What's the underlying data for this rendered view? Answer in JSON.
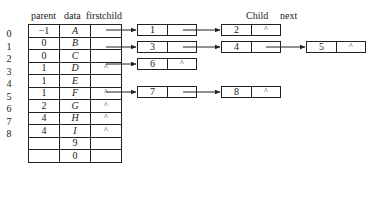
{
  "headers": {
    "parent": "parent",
    "data": "data",
    "firstchild": "firstchild",
    "child": "Child",
    "next": "next"
  },
  "rows": [
    {
      "index": "0",
      "parent": "−1",
      "data": "A",
      "firstchild": ""
    },
    {
      "index": "1",
      "parent": "0",
      "data": "B",
      "firstchild": ""
    },
    {
      "index": "2",
      "parent": "0",
      "data": "C",
      "firstchild": ""
    },
    {
      "index": "3",
      "parent": "1",
      "data": "D",
      "firstchild": "^"
    },
    {
      "index": "4",
      "parent": "1",
      "data": "E",
      "firstchild": ""
    },
    {
      "index": "5",
      "parent": "1",
      "data": "F",
      "firstchild": "^"
    },
    {
      "index": "6",
      "parent": "2",
      "data": "G",
      "firstchild": "^"
    },
    {
      "index": "7",
      "parent": "4",
      "data": "H",
      "firstchild": "^"
    },
    {
      "index": "8",
      "parent": "4",
      "data": "I",
      "firstchild": "^"
    },
    {
      "index": "",
      "parent": "",
      "data": "9",
      "firstchild": ""
    },
    {
      "index": "",
      "parent": "",
      "data": "0",
      "firstchild": ""
    }
  ],
  "nodes": {
    "n1": {
      "child": "1",
      "next": ""
    },
    "n3": {
      "child": "3",
      "next": ""
    },
    "n6": {
      "child": "6",
      "next": "^"
    },
    "n7": {
      "child": "7",
      "next": ""
    },
    "n2": {
      "child": "2",
      "next": "^"
    },
    "n4": {
      "child": "4",
      "next": ""
    },
    "n8": {
      "child": "8",
      "next": "^"
    },
    "n5": {
      "child": "5",
      "next": "^"
    }
  }
}
